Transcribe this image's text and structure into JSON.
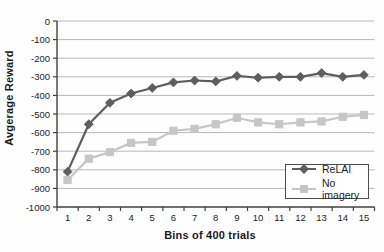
{
  "figure": {
    "background": "#fefefe",
    "plot_background": "#ffffff"
  },
  "axes": {
    "axis_color": "#404040",
    "grid_color": "#b8b8b8",
    "tick_text_color": "#1c1c1c",
    "legend_border_color": "#4d4d4d"
  },
  "chart_data": {
    "type": "line",
    "title": "",
    "xlabel": "Bins of 400 trials",
    "ylabel": "Avgerage Reward",
    "categories": [
      "1",
      "2",
      "3",
      "4",
      "5",
      "6",
      "7",
      "8",
      "9",
      "10",
      "11",
      "12",
      "13",
      "14",
      "15"
    ],
    "series": [
      {
        "key": "relai",
        "name": "ReLAI",
        "marker": "diamond",
        "color": "#5e5e5e",
        "values": [
          -810,
          -555,
          -440,
          -390,
          -360,
          -330,
          -320,
          -325,
          -295,
          -305,
          -300,
          -300,
          -280,
          -300,
          -290
        ]
      },
      {
        "key": "no-imagery",
        "name": "No imagery",
        "marker": "square",
        "color": "#c6c6c6",
        "values": [
          -855,
          -740,
          -705,
          -655,
          -650,
          -590,
          -580,
          -555,
          -520,
          -545,
          -555,
          -545,
          -540,
          -515,
          -505
        ]
      }
    ],
    "ylim": [
      -1000,
      0
    ],
    "yticks": [
      0,
      -100,
      -200,
      -300,
      -400,
      -500,
      -600,
      -700,
      -800,
      -900,
      -1000
    ],
    "ytick_labels": [
      "0",
      "-100",
      "-200",
      "-300",
      "-400",
      "-500",
      "-600",
      "-700",
      "-800",
      "-900",
      "-1000"
    ],
    "grid": true,
    "legend_position": "inside-lower-right"
  }
}
